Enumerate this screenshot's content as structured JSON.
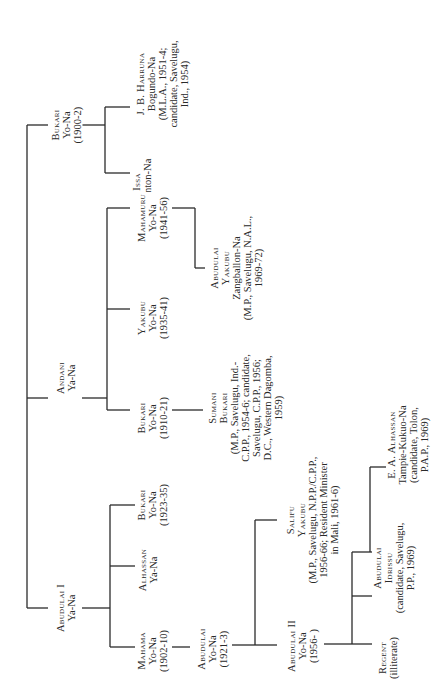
{
  "diagram": {
    "type": "genealogy-tree",
    "orientation": "rotated-90-counterclockwise",
    "nodes": {
      "bukari_1900": {
        "name": "Bukari",
        "lines": [
          "Yo-Na",
          "(1900-2)"
        ]
      },
      "issa": {
        "name": "Issa",
        "lines": [
          "Nanton-Na"
        ]
      },
      "jb_harruna": {
        "name": "J. B. Harruna",
        "lines": [
          "Bogundo-Na",
          "(M.L.A., 1951-4;",
          "candidate, Savelugu,",
          "Ind., 1954)"
        ]
      },
      "andani": {
        "name": "Andani",
        "lines": [
          "Ya-Na"
        ]
      },
      "bukari_1910": {
        "name": "Bukari",
        "lines": [
          "Yo-Na",
          "(1910-21)"
        ]
      },
      "yakubu": {
        "name": "Yakubu",
        "lines": [
          "Yo-Na",
          "(1935-41)"
        ]
      },
      "mahamuru": {
        "name": "Mahamuru",
        "lines": [
          "Yo-Na",
          "(1941-56)"
        ]
      },
      "sumani_bukari": {
        "name1": "Sumani",
        "name2": "Bukari",
        "lines": [
          "(M.P., Savelugu, Ind.-",
          "C.P.P., 1954-6; candidate,",
          "Savelugu, C.P.P., 1956;",
          "D.C., Western Dagomba,",
          "1959)"
        ]
      },
      "abudulai_yakubu": {
        "name1": "Abudulai",
        "name2": "Yakubu",
        "lines": [
          "Zangballon-Na",
          "(M.P., Savelugu, N.A.L.,",
          "1969-72)"
        ]
      },
      "abudulai_i": {
        "name": "Abudulai I",
        "lines": [
          "Ya-Na"
        ]
      },
      "mahama": {
        "name": "Mahama",
        "lines": [
          "Yo-Na",
          "(1902-10)"
        ]
      },
      "alhassan": {
        "name": "Alhassan",
        "lines": [
          "Ya-Na"
        ]
      },
      "bukari_1923": {
        "name": "Bukari",
        "lines": [
          "Yo-Na",
          "(1923-35)"
        ]
      },
      "abudulai_1921": {
        "name": "Abudulai",
        "lines": [
          "Yo-Na",
          "(1921-3)"
        ]
      },
      "abudulai_ii": {
        "name": "Abudulai II",
        "lines": [
          "Yo-Na",
          "(1956-   )"
        ]
      },
      "salifu_yakubu": {
        "name1": "Salifu",
        "name2": "Yakubu",
        "lines": [
          "(M.P., Savelugu, N.P.P./C.P.P.,",
          "1956-66; Resident Minister",
          "in Mali, 1961-6)"
        ]
      },
      "regent": {
        "name": "Regent",
        "lines": [
          "(illiterate)"
        ]
      },
      "abudulai_idrissu": {
        "name1": "Abudulai",
        "name2": "Idrissu",
        "lines": [
          "(candidate, Savelugu,",
          "P.P., 1969)"
        ]
      },
      "ea_alhassan": {
        "name": "E. A. Alhassan",
        "lines": [
          "Tampie-Kukuo-Na",
          "(candidate, Tolon,",
          "P.A.P., 1969)"
        ]
      }
    }
  }
}
